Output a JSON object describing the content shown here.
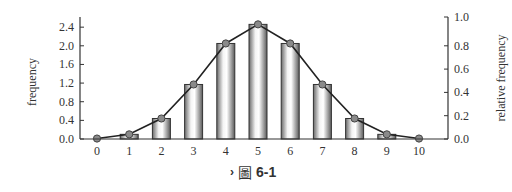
{
  "chart_data": {
    "type": "bar",
    "title": "",
    "xlabel": "",
    "ylabel": "frequency",
    "y2label": "relative frequency",
    "categories": [
      "0",
      "1",
      "2",
      "3",
      "4",
      "5",
      "6",
      "7",
      "8",
      "9",
      "10"
    ],
    "series": [
      {
        "name": "frequency (bars)",
        "type": "bar",
        "values": [
          0.01,
          0.1,
          0.44,
          1.17,
          2.05,
          2.46,
          2.05,
          1.17,
          0.44,
          0.1,
          0.01
        ]
      },
      {
        "name": "relative frequency (line)",
        "type": "line",
        "values": [
          0.004,
          0.04,
          0.176,
          0.468,
          0.82,
          0.984,
          0.82,
          0.468,
          0.176,
          0.04,
          0.004
        ]
      }
    ],
    "ylim": [
      0,
      2.5
    ],
    "yticks": [
      "0.0",
      "0.4",
      "0.8",
      "1.2",
      "1.6",
      "2.0",
      "2.4"
    ],
    "y2lim": [
      0,
      1.0
    ],
    "y2ticks": [
      "0.0",
      "0.2",
      "0.4",
      "0.6",
      "0.8",
      "1.0"
    ],
    "grid": false,
    "legend": null
  },
  "caption": {
    "marker": "›",
    "glyph": "圖",
    "label": "6-1"
  }
}
